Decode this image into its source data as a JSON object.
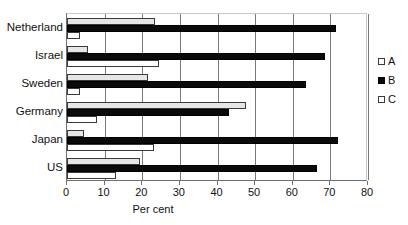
{
  "chart_data": {
    "type": "bar",
    "orientation": "horizontal",
    "title": "",
    "xlabel": "Per cent",
    "ylabel": "",
    "xlim": [
      0,
      80
    ],
    "xticks": [
      0,
      10,
      20,
      30,
      40,
      50,
      60,
      70,
      80
    ],
    "grid": true,
    "legend_position": "right",
    "categories": [
      "Netherland",
      "Israel",
      "Sweden",
      "Germany",
      "Japan",
      "US"
    ],
    "series": [
      {
        "name": "A",
        "color": "#e6e6e6",
        "values": [
          23.5,
          5.5,
          21.5,
          47.5,
          4.5,
          19.5
        ]
      },
      {
        "name": "B",
        "color": "#0a0a0a",
        "values": [
          71.5,
          68.5,
          63.5,
          43.0,
          72.0,
          66.5
        ]
      },
      {
        "name": "C",
        "color": "#ffffff",
        "values": [
          3.5,
          24.5,
          3.5,
          8.0,
          23.0,
          13.0
        ]
      }
    ]
  },
  "axis": {
    "tick_labels": [
      "0",
      "10",
      "20",
      "30",
      "40",
      "50",
      "60",
      "70",
      "80"
    ],
    "title": "Per cent"
  },
  "legend": {
    "items": [
      {
        "label": "A",
        "swatch": "legend-swatch-a"
      },
      {
        "label": "B",
        "swatch": "legend-swatch-b"
      },
      {
        "label": "C",
        "swatch": "legend-swatch-c"
      }
    ]
  },
  "categories": {
    "items": [
      "Netherland",
      "Israel",
      "Sweden",
      "Germany",
      "Japan",
      "US"
    ]
  }
}
